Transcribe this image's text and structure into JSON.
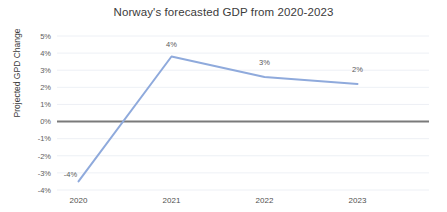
{
  "chart_data": {
    "type": "line",
    "title": "Norway's forecasted GDP from 2020-2023",
    "xlabel": "",
    "ylabel": "Projected GPD Change",
    "categories": [
      "2020",
      "2021",
      "2022",
      "2023"
    ],
    "values": [
      -3.5,
      3.8,
      2.6,
      2.2
    ],
    "point_labels": [
      "-4%",
      "4%",
      "3%",
      "2%"
    ],
    "ylim": [
      -4,
      5
    ],
    "ytick_labels": [
      "5%",
      "4%",
      "3%",
      "2%",
      "1%",
      "0%",
      "-1%",
      "-2%",
      "-3%",
      "-4%"
    ],
    "ytick_values": [
      5,
      4,
      3,
      2,
      1,
      0,
      -1,
      -2,
      -3,
      -4
    ],
    "grid": true,
    "legend": "none",
    "series_color": "#8faadc",
    "zero_line_color": "#7a7a7a",
    "gridline_color": "#e9ecf2",
    "background_color": "#ffffff"
  }
}
